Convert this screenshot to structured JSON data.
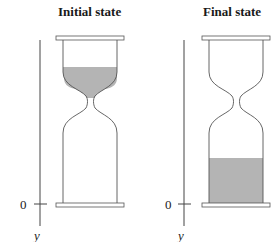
{
  "panels": [
    {
      "title": "Initial state",
      "sand_location": "upper bulb",
      "axis": {
        "zero_label": "0",
        "axis_label": "y"
      }
    },
    {
      "title": "Final state",
      "sand_location": "lower bulb",
      "axis": {
        "zero_label": "0",
        "axis_label": "y"
      }
    }
  ],
  "colors": {
    "sand": "#b4b4b4",
    "outline": "#555555",
    "background": "#ffffff"
  }
}
